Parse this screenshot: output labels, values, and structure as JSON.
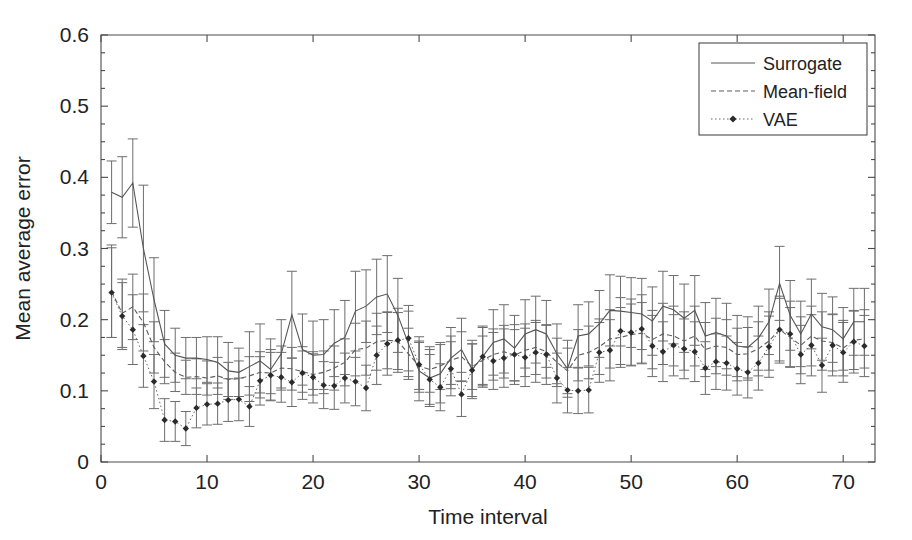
{
  "chart_data": {
    "type": "line",
    "title": "",
    "xlabel": "Time interval",
    "ylabel": "Mean average error",
    "xlim": [
      0,
      73
    ],
    "ylim": [
      0,
      0.6
    ],
    "grid": false,
    "legend_position": "top-right",
    "xticks": [
      0,
      10,
      20,
      30,
      40,
      50,
      60,
      70
    ],
    "xtick_labels": [
      "0",
      "10",
      "20",
      "30",
      "40",
      "50",
      "60",
      "70"
    ],
    "yticks": [
      0,
      0.1,
      0.2,
      0.3,
      0.4,
      0.5,
      0.6
    ],
    "ytick_labels": [
      "0",
      "0.1",
      "0.2",
      "0.3",
      "0.4",
      "0.5",
      "0.6"
    ],
    "x": [
      1,
      2,
      3,
      4,
      5,
      6,
      7,
      8,
      9,
      10,
      11,
      12,
      13,
      14,
      15,
      16,
      17,
      18,
      19,
      20,
      21,
      22,
      23,
      24,
      25,
      26,
      27,
      28,
      29,
      30,
      31,
      32,
      33,
      34,
      35,
      36,
      37,
      38,
      39,
      40,
      41,
      42,
      43,
      44,
      45,
      46,
      47,
      48,
      49,
      50,
      51,
      52,
      53,
      54,
      55,
      56,
      57,
      58,
      59,
      60,
      61,
      62,
      63,
      64,
      65,
      66,
      67,
      68,
      69,
      70,
      71,
      72
    ],
    "series": [
      {
        "name": "Surrogate",
        "style": "solid",
        "values": [
          0.379,
          0.372,
          0.392,
          0.3,
          0.228,
          0.166,
          0.15,
          0.146,
          0.146,
          0.144,
          0.14,
          0.128,
          0.126,
          0.134,
          0.142,
          0.13,
          0.152,
          0.207,
          0.158,
          0.15,
          0.151,
          0.167,
          0.175,
          0.212,
          0.219,
          0.232,
          0.236,
          0.206,
          0.166,
          0.128,
          0.118,
          0.124,
          0.146,
          0.158,
          0.13,
          0.148,
          0.168,
          0.173,
          0.16,
          0.18,
          0.186,
          0.18,
          0.152,
          0.131,
          0.177,
          0.18,
          0.194,
          0.213,
          0.212,
          0.21,
          0.208,
          0.198,
          0.219,
          0.214,
          0.202,
          0.213,
          0.177,
          0.182,
          0.177,
          0.163,
          0.161,
          0.174,
          0.197,
          0.251,
          0.206,
          0.18,
          0.208,
          0.19,
          0.186,
          0.173,
          0.197,
          0.197
        ],
        "errors": [
          0.044,
          0.057,
          0.062,
          0.089,
          0.059,
          0.047,
          0.038,
          0.029,
          0.029,
          0.032,
          0.036,
          0.04,
          0.034,
          0.049,
          0.052,
          0.043,
          0.048,
          0.061,
          0.05,
          0.048,
          0.049,
          0.047,
          0.052,
          0.056,
          0.051,
          0.053,
          0.054,
          0.052,
          0.046,
          0.042,
          0.04,
          0.041,
          0.043,
          0.044,
          0.041,
          0.043,
          0.046,
          0.048,
          0.046,
          0.048,
          0.047,
          0.047,
          0.042,
          0.04,
          0.044,
          0.045,
          0.047,
          0.05,
          0.049,
          0.049,
          0.05,
          0.048,
          0.049,
          0.048,
          0.048,
          0.049,
          0.047,
          0.048,
          0.046,
          0.043,
          0.043,
          0.045,
          0.046,
          0.052,
          0.049,
          0.046,
          0.049,
          0.047,
          0.046,
          0.044,
          0.047,
          0.047
        ]
      },
      {
        "name": "Mean-field",
        "style": "dashed",
        "values": [
          0.24,
          0.209,
          0.218,
          0.196,
          0.161,
          0.141,
          0.126,
          0.119,
          0.12,
          0.118,
          0.121,
          0.116,
          0.117,
          0.121,
          0.126,
          0.125,
          0.132,
          0.131,
          0.127,
          0.123,
          0.126,
          0.132,
          0.14,
          0.158,
          0.16,
          0.169,
          0.171,
          0.17,
          0.152,
          0.135,
          0.13,
          0.135,
          0.143,
          0.148,
          0.134,
          0.143,
          0.151,
          0.155,
          0.15,
          0.157,
          0.161,
          0.155,
          0.14,
          0.128,
          0.15,
          0.154,
          0.162,
          0.173,
          0.175,
          0.179,
          0.181,
          0.172,
          0.18,
          0.177,
          0.17,
          0.177,
          0.158,
          0.163,
          0.161,
          0.151,
          0.152,
          0.159,
          0.17,
          0.186,
          0.175,
          0.164,
          0.177,
          0.17,
          0.168,
          0.16,
          0.171,
          0.173
        ],
        "errors": [
          0.065,
          0.048,
          0.046,
          0.04,
          0.036,
          0.031,
          0.027,
          0.024,
          0.025,
          0.024,
          0.026,
          0.024,
          0.025,
          0.027,
          0.029,
          0.029,
          0.031,
          0.03,
          0.029,
          0.029,
          0.03,
          0.031,
          0.033,
          0.037,
          0.038,
          0.04,
          0.04,
          0.04,
          0.036,
          0.033,
          0.032,
          0.033,
          0.034,
          0.035,
          0.032,
          0.034,
          0.036,
          0.037,
          0.036,
          0.037,
          0.038,
          0.037,
          0.034,
          0.032,
          0.036,
          0.037,
          0.039,
          0.041,
          0.042,
          0.043,
          0.043,
          0.041,
          0.043,
          0.042,
          0.041,
          0.042,
          0.038,
          0.039,
          0.039,
          0.037,
          0.037,
          0.038,
          0.041,
          0.044,
          0.042,
          0.04,
          0.042,
          0.041,
          0.04,
          0.039,
          0.041,
          0.041
        ]
      },
      {
        "name": "VAE",
        "style": "dotted-marker",
        "values": [
          0.238,
          0.205,
          0.186,
          0.149,
          0.113,
          0.059,
          0.057,
          0.047,
          0.076,
          0.081,
          0.082,
          0.087,
          0.088,
          0.078,
          0.114,
          0.122,
          0.119,
          0.112,
          0.125,
          0.119,
          0.108,
          0.107,
          0.118,
          0.113,
          0.104,
          0.15,
          0.166,
          0.171,
          0.174,
          0.137,
          0.116,
          0.105,
          0.131,
          0.095,
          0.129,
          0.148,
          0.142,
          0.146,
          0.151,
          0.147,
          0.154,
          0.151,
          0.118,
          0.101,
          0.1,
          0.101,
          0.154,
          0.157,
          0.184,
          0.182,
          0.187,
          0.163,
          0.155,
          0.164,
          0.159,
          0.155,
          0.132,
          0.141,
          0.139,
          0.131,
          0.126,
          0.139,
          0.162,
          0.186,
          0.18,
          0.151,
          0.164,
          0.136,
          0.164,
          0.154,
          0.169,
          0.163
        ],
        "errors": [
          0.063,
          0.047,
          0.049,
          0.044,
          0.038,
          0.03,
          0.028,
          0.024,
          0.028,
          0.029,
          0.029,
          0.03,
          0.03,
          0.028,
          0.034,
          0.036,
          0.035,
          0.034,
          0.037,
          0.036,
          0.033,
          0.033,
          0.035,
          0.034,
          0.032,
          0.041,
          0.044,
          0.045,
          0.046,
          0.039,
          0.035,
          0.033,
          0.038,
          0.031,
          0.037,
          0.041,
          0.04,
          0.041,
          0.042,
          0.041,
          0.042,
          0.042,
          0.035,
          0.032,
          0.032,
          0.032,
          0.042,
          0.043,
          0.047,
          0.047,
          0.048,
          0.043,
          0.042,
          0.043,
          0.042,
          0.042,
          0.037,
          0.039,
          0.038,
          0.037,
          0.036,
          0.038,
          0.043,
          0.047,
          0.046,
          0.041,
          0.043,
          0.038,
          0.043,
          0.042,
          0.044,
          0.043
        ]
      }
    ]
  },
  "legend": {
    "items": [
      {
        "label": "Surrogate"
      },
      {
        "label": "Mean-field"
      },
      {
        "label": "VAE"
      }
    ]
  },
  "colors": {
    "surrogate": "#555555",
    "meanfield": "#5e5e5e",
    "vae": "#666666",
    "errorbar": "#6d6d6d",
    "axis": "#4a4a4a",
    "background": "#ffffff"
  }
}
